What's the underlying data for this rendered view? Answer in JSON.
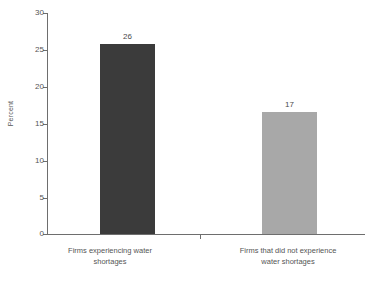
{
  "chart_data": {
    "type": "bar",
    "title": "",
    "xlabel": "",
    "ylabel": "Percent",
    "ylim": [
      0,
      30
    ],
    "yticks": [
      0,
      5,
      10,
      15,
      20,
      25,
      30
    ],
    "grid": false,
    "legend": "none",
    "categories": [
      "Firms experiencing water shortages",
      "Firms that did not experience water shortages"
    ],
    "values": [
      25.7,
      16.5
    ],
    "data_labels": [
      "26",
      "17"
    ],
    "colors": [
      "#3b3b3b",
      "#a8a8a8"
    ]
  },
  "axis": {
    "y_title": "Percent",
    "tick_labels": [
      "30",
      "25",
      "20",
      "15",
      "10",
      "5",
      "0"
    ]
  },
  "bars": [
    {
      "label_line1": "Firms experiencing water",
      "label_line2": "shortages",
      "value_label": "26",
      "value": 25.7,
      "color": "#3b3b3b"
    },
    {
      "label_line1": "Firms that did not experience",
      "label_line2": "water shortages",
      "value_label": "17",
      "value": 16.5,
      "color": "#a8a8a8"
    }
  ]
}
